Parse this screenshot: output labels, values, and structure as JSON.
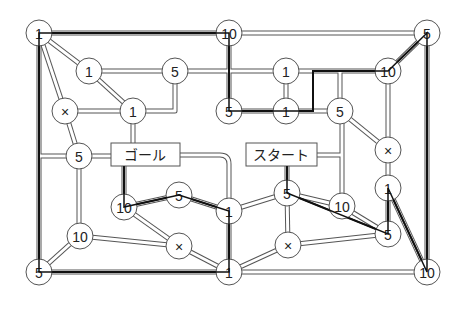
{
  "diagram": {
    "title": "",
    "labels": {
      "goal": "ゴール",
      "start": "スタート"
    },
    "nodes": [
      {
        "id": "A",
        "x": 39,
        "y": 33,
        "value": "1"
      },
      {
        "id": "B",
        "x": 229,
        "y": 33,
        "value": "10"
      },
      {
        "id": "C",
        "x": 427,
        "y": 33,
        "value": "5"
      },
      {
        "id": "D",
        "x": 89,
        "y": 71,
        "value": "1"
      },
      {
        "id": "E",
        "x": 175,
        "y": 71,
        "value": "5"
      },
      {
        "id": "F",
        "x": 286,
        "y": 71,
        "value": "1"
      },
      {
        "id": "G",
        "x": 388,
        "y": 71,
        "value": "10"
      },
      {
        "id": "H",
        "x": 65,
        "y": 111,
        "value": "×"
      },
      {
        "id": "I",
        "x": 133,
        "y": 111,
        "value": "1"
      },
      {
        "id": "J",
        "x": 229,
        "y": 111,
        "value": "5"
      },
      {
        "id": "K",
        "x": 286,
        "y": 111,
        "value": "1"
      },
      {
        "id": "L",
        "x": 340,
        "y": 111,
        "value": "5"
      },
      {
        "id": "M",
        "x": 388,
        "y": 150,
        "value": "×"
      },
      {
        "id": "N",
        "x": 79,
        "y": 156,
        "value": "5"
      },
      {
        "id": "O",
        "x": 388,
        "y": 188,
        "value": "1"
      },
      {
        "id": "P",
        "x": 124,
        "y": 207,
        "value": "10"
      },
      {
        "id": "Q",
        "x": 179,
        "y": 195,
        "value": "5"
      },
      {
        "id": "R",
        "x": 229,
        "y": 211,
        "value": "1"
      },
      {
        "id": "S",
        "x": 287,
        "y": 193,
        "value": "5"
      },
      {
        "id": "T",
        "x": 342,
        "y": 206,
        "value": "10"
      },
      {
        "id": "U",
        "x": 80,
        "y": 236,
        "value": "10"
      },
      {
        "id": "V",
        "x": 179,
        "y": 246,
        "value": "×"
      },
      {
        "id": "W",
        "x": 288,
        "y": 245,
        "value": "×"
      },
      {
        "id": "X",
        "x": 388,
        "y": 234,
        "value": "5"
      },
      {
        "id": "Y",
        "x": 39,
        "y": 272,
        "value": "5"
      },
      {
        "id": "Z",
        "x": 229,
        "y": 272,
        "value": "1"
      },
      {
        "id": "AA",
        "x": 427,
        "y": 272,
        "value": "10"
      }
    ],
    "legend_notes": {
      "blocked_symbol": "×"
    },
    "colors": {
      "road": "#555555",
      "path": "#111111",
      "background": "#ffffff"
    }
  }
}
